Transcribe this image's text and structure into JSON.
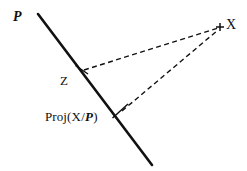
{
  "figure": {
    "width": 247,
    "height": 171,
    "background_color": "#ffffff",
    "stroke_color": "#111111"
  },
  "labels": {
    "subspace": "P",
    "point_x": "X",
    "point_z": "Z",
    "projection_prefix": "Proj(",
    "projection_numerator": "X",
    "projection_slash": "/",
    "projection_denominator": "P",
    "projection_suffix": ")",
    "projection_full": "Proj(X/P)"
  },
  "chart_data": {
    "type": "diagram",
    "xlabel": "",
    "ylabel": "",
    "xlim": [
      0,
      247
    ],
    "ylim": [
      0,
      171
    ],
    "grid": false,
    "legend": "none",
    "points": [
      {
        "name": "P_line_start",
        "label": "",
        "x": 38,
        "y": 14,
        "marker": "none"
      },
      {
        "name": "P_line_end",
        "label": "",
        "x": 152,
        "y": 165,
        "marker": "none"
      },
      {
        "name": "Z",
        "label": "Z",
        "x": 82,
        "y": 70,
        "marker": "tick"
      },
      {
        "name": "Proj(X/P)",
        "label": "Proj(X/P)",
        "x": 120,
        "y": 112,
        "marker": "tick"
      },
      {
        "name": "X",
        "label": "X",
        "x": 220,
        "y": 27,
        "marker": "plus"
      }
    ],
    "series": [
      {
        "name": "subspace-P",
        "style": "solid",
        "width": 2.6,
        "color": "#111111",
        "points": [
          [
            38,
            14
          ],
          [
            152,
            165
          ]
        ]
      },
      {
        "name": "Z-to-X",
        "style": "dashed",
        "width": 1.4,
        "color": "#111111",
        "points": [
          [
            84,
            70
          ],
          [
            218,
            28
          ]
        ]
      },
      {
        "name": "Proj-to-X",
        "style": "dashed",
        "width": 1.4,
        "color": "#111111",
        "points": [
          [
            122,
            111
          ],
          [
            218,
            30
          ]
        ]
      }
    ],
    "annotations": [
      {
        "text": "P",
        "x": 14,
        "y": 18,
        "style": "bold-italic"
      },
      {
        "text": "X",
        "x": 228,
        "y": 28,
        "style": "roman"
      },
      {
        "text": "Z",
        "x": 64,
        "y": 82,
        "style": "roman"
      },
      {
        "text": "Proj(X/P)",
        "x": 46,
        "y": 124,
        "style": "mixed"
      }
    ]
  }
}
